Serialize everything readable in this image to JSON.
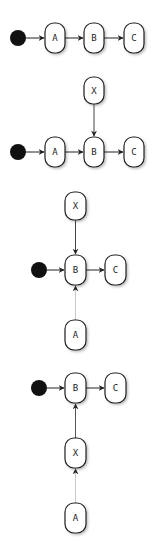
{
  "colors": {
    "stroke": "#222222",
    "fill": "#ffffff",
    "start": "#111111",
    "faint_edge": "#c8c8c8",
    "shadow": "#d8d8d8"
  },
  "diagrams": [
    {
      "name": "linear-flow",
      "start": {
        "cx": 18,
        "cy": 38
      },
      "nodes": [
        {
          "id": "A",
          "label": "A",
          "x": 45,
          "y": 23
        },
        {
          "id": "B",
          "label": "B",
          "x": 84,
          "y": 23
        },
        {
          "id": "C",
          "label": "C",
          "x": 124,
          "y": 23
        }
      ]
    },
    {
      "name": "x-inserted-above-b",
      "start": {
        "cx": 18,
        "cy": 152
      },
      "nodes": [
        {
          "id": "X",
          "label": "X",
          "x": 84,
          "y": 77
        },
        {
          "id": "A",
          "label": "A",
          "x": 45,
          "y": 137
        },
        {
          "id": "B",
          "label": "B",
          "x": 84,
          "y": 137
        },
        {
          "id": "C",
          "label": "C",
          "x": 124,
          "y": 137
        }
      ]
    },
    {
      "name": "a-moved-below-b",
      "start": {
        "cx": 39,
        "cy": 270
      },
      "nodes": [
        {
          "id": "X",
          "label": "X",
          "x": 65,
          "y": 192
        },
        {
          "id": "B",
          "label": "B",
          "x": 65,
          "y": 255
        },
        {
          "id": "C",
          "label": "C",
          "x": 105,
          "y": 255
        },
        {
          "id": "A",
          "label": "A",
          "x": 65,
          "y": 320
        }
      ]
    },
    {
      "name": "x-chained-below-b",
      "start": {
        "cx": 39,
        "cy": 388
      },
      "nodes": [
        {
          "id": "B",
          "label": "B",
          "x": 65,
          "y": 373
        },
        {
          "id": "C",
          "label": "C",
          "x": 105,
          "y": 373
        },
        {
          "id": "X",
          "label": "X",
          "x": 65,
          "y": 438
        },
        {
          "id": "A",
          "label": "A",
          "x": 65,
          "y": 503
        }
      ]
    }
  ]
}
